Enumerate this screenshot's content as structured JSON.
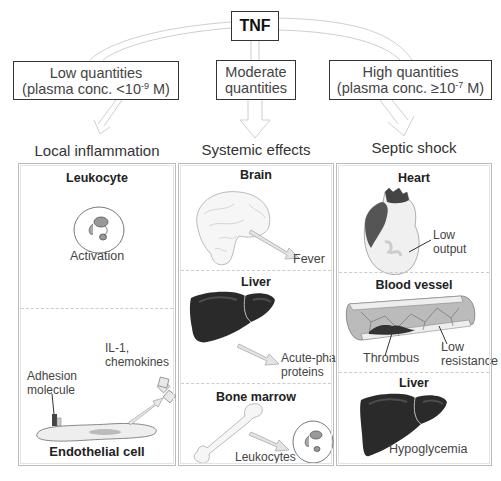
{
  "root": {
    "label": "TNF"
  },
  "quantities": [
    {
      "line1": "Low quantities",
      "line2_prefix": "(plasma conc. <10",
      "exponent": "-9",
      "line2_suffix": " M)"
    },
    {
      "line1": "Moderate",
      "line2": "quantities"
    },
    {
      "line1": "High quantities",
      "line2_prefix": "(plasma conc. ≥10",
      "exponent": "-7",
      "line2_suffix": " M)"
    }
  ],
  "columns": [
    {
      "heading": "Local inflammation",
      "sections": [
        {
          "title": "Leukocyte",
          "labels": [
            "Activation"
          ]
        },
        {
          "title": "Endothelial cell",
          "labels": [
            "Adhesion",
            "molecule",
            "IL-1,",
            "chemokines"
          ]
        }
      ]
    },
    {
      "heading": "Systemic effects",
      "sections": [
        {
          "title": "Brain",
          "labels": [
            "Fever"
          ]
        },
        {
          "title": "Liver",
          "labels": [
            "Acute-phase",
            "proteins"
          ]
        },
        {
          "title": "Bone marrow",
          "labels": [
            "Leukocytes"
          ]
        }
      ]
    },
    {
      "heading": "Septic shock",
      "sections": [
        {
          "title": "Heart",
          "labels": [
            "Low",
            "output"
          ]
        },
        {
          "title": "Blood vessel",
          "labels": [
            "Thrombus",
            "Low",
            "resistance"
          ]
        },
        {
          "title": "Liver",
          "labels": [
            "Hypoglycemia"
          ]
        }
      ]
    }
  ],
  "colors": {
    "box_border": "#333333",
    "arrow_outline": "#c8c8c8",
    "organ_dark": "#2a2a2a",
    "panel_border": "#bbbbbb"
  }
}
